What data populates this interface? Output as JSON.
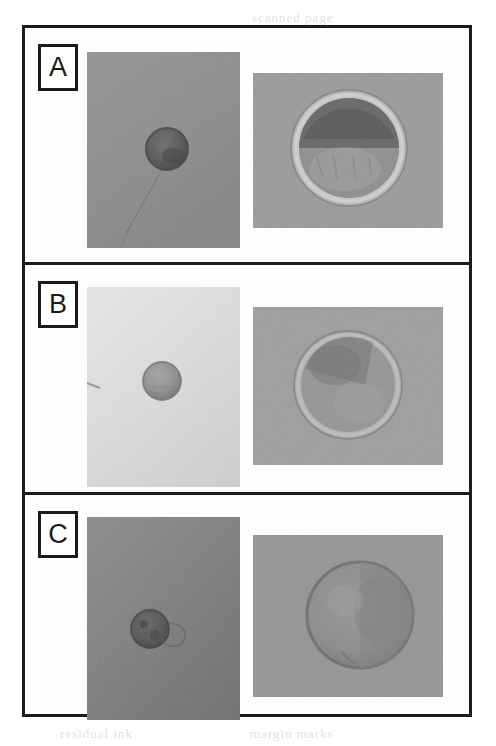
{
  "figure": {
    "kind": "microscopy-figure",
    "panel_count": 3,
    "frame_color": "#1c1c1c",
    "background_color": "#ffffff",
    "panels": [
      {
        "id": "a",
        "label": "A",
        "images": [
          {
            "position": "left",
            "view": "low-magnification",
            "field_color": "#8e8e8e",
            "cell": {
              "shape": "circle",
              "fill": "#5a5a5a",
              "rim": "#4a4a4a",
              "cx_pct": 52,
              "cy_pct": 50,
              "diameter_pct": 27
            },
            "artifact": "diagonal-fibre"
          },
          {
            "position": "right",
            "view": "high-magnification",
            "field_color": "#9b9b9b",
            "cell": {
              "shape": "circle",
              "fill": "#8a8a8a",
              "rim": "#c9c9c9",
              "cx_pct": 50,
              "cy_pct": 48,
              "diameter_pct": 72,
              "dark_cap": "#6a6a6a"
            },
            "artifact": "none"
          }
        ]
      },
      {
        "id": "b",
        "label": "B",
        "images": [
          {
            "position": "left",
            "view": "low-magnification",
            "field_color": "#d9d9d9",
            "cell": {
              "shape": "circle",
              "fill": "#949494",
              "rim": "#7d7d7d",
              "cx_pct": 49,
              "cy_pct": 47,
              "diameter_pct": 24
            },
            "artifact": "edge-speck"
          },
          {
            "position": "right",
            "view": "high-magnification",
            "field_color": "#9e9e9e",
            "cell": {
              "shape": "circle",
              "fill": "#939393",
              "rim": "#b9b9b9",
              "cx_pct": 50,
              "cy_pct": 49,
              "diameter_pct": 68,
              "dark_cap": "#7c7c7c"
            },
            "artifact": "none"
          }
        ]
      },
      {
        "id": "c",
        "label": "C",
        "images": [
          {
            "position": "left",
            "view": "low-magnification",
            "field_color": "#7c7c7c",
            "cell": {
              "shape": "circle",
              "fill": "#555555",
              "rim": "#464646",
              "cx_pct": 41,
              "cy_pct": 55,
              "diameter_pct": 24
            },
            "artifact": "curved-debris"
          },
          {
            "position": "right",
            "view": "high-magnification",
            "field_color": "#949494",
            "cell": {
              "shape": "circle",
              "fill": "#878787",
              "rim": "#6d6d6d",
              "cx_pct": 56,
              "cy_pct": 50,
              "diameter_pct": 70,
              "dark_cap": "#7a7a7a"
            },
            "artifact": "none"
          }
        ]
      }
    ]
  },
  "bleed_through": [
    {
      "text": "scanned page",
      "x": 252,
      "y": 10,
      "size": 13
    },
    {
      "text": "reverse side text",
      "x": 236,
      "y": 118,
      "size": 14
    },
    {
      "text": "faint print",
      "x": 246,
      "y": 284,
      "size": 13
    },
    {
      "text": "ghosted letters",
      "x": 236,
      "y": 380,
      "size": 15
    },
    {
      "text": "show through",
      "x": 244,
      "y": 450,
      "size": 15
    },
    {
      "text": "paper fibres",
      "x": 250,
      "y": 510,
      "size": 13
    },
    {
      "text": "residual ink",
      "x": 60,
      "y": 726,
      "size": 13
    },
    {
      "text": "margin marks",
      "x": 250,
      "y": 726,
      "size": 13
    }
  ]
}
